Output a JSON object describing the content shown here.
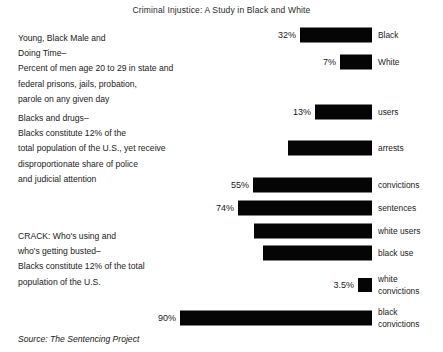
{
  "title": "Criminal Injustice: A Study in Black and White",
  "source": "Source: The Sentencing Project",
  "text_blocks": [
    {
      "lines": [
        "Young, Black Male and",
        "Doing Time–",
        "Percent of men age 20 to 29 in state and",
        "federal prisons, jails, probation,",
        "parole on any given day"
      ]
    },
    {
      "lines": [
        "Blacks and drugs–",
        "Blacks constitute 12% of the",
        "total population of the U.S., yet receive",
        "disproportionate share of police",
        "and judicial attention"
      ]
    },
    {
      "lines": [
        "CRACK: Who's using and",
        "who's getting busted–",
        "Blacks constitute 12% of the total",
        "population of the U.S."
      ]
    }
  ],
  "chart_data": {
    "type": "bar",
    "title": "Criminal Injustice: A Study in Black and White",
    "xlabel": "",
    "ylabel": "",
    "orientation": "horizontal",
    "bars_right_aligned": true,
    "grid": false,
    "legend": "none",
    "xlim": [
      0,
      100
    ],
    "categories": [
      "Black",
      "White",
      "users",
      "arrests",
      "convictions",
      "sentences",
      "white users",
      "black use",
      "white convictions",
      "black convictions"
    ],
    "values": [
      32,
      7,
      13,
      28,
      55,
      74,
      52,
      47,
      3.5,
      90
    ],
    "value_labels": [
      "32%",
      "7%",
      "13%",
      "",
      "55%",
      "74%",
      "",
      "",
      "3.5%",
      "90%"
    ],
    "bars": [
      {
        "label": "Black",
        "label_lines": [
          "Black"
        ],
        "value": 32,
        "value_label": "32%",
        "top": 35,
        "left": 300,
        "width": 72,
        "labeled": true
      },
      {
        "label": "White",
        "label_lines": [
          "White"
        ],
        "value": 7,
        "value_label": "7%",
        "top": 62,
        "left": 340,
        "width": 32,
        "labeled": true
      },
      {
        "label": "users",
        "label_lines": [
          "users"
        ],
        "value": 13,
        "value_label": "13%",
        "top": 112,
        "left": 315,
        "width": 57,
        "labeled": true
      },
      {
        "label": "arrests",
        "label_lines": [
          "arrests"
        ],
        "value": 28,
        "value_label": "",
        "top": 148,
        "left": 288,
        "width": 84,
        "labeled": false
      },
      {
        "label": "convictions",
        "label_lines": [
          "convictions"
        ],
        "value": 55,
        "value_label": "55%",
        "top": 185,
        "left": 253,
        "width": 119,
        "labeled": true
      },
      {
        "label": "sentences",
        "label_lines": [
          "sentences"
        ],
        "value": 74,
        "value_label": "74%",
        "top": 208,
        "left": 238,
        "width": 134,
        "labeled": true
      },
      {
        "label": "white users",
        "label_lines": [
          "white users"
        ],
        "value": 52,
        "value_label": "",
        "top": 231,
        "left": 254,
        "width": 118,
        "labeled": false
      },
      {
        "label": "black use",
        "label_lines": [
          "black use"
        ],
        "value": 47,
        "value_label": "",
        "top": 253,
        "left": 263,
        "width": 109,
        "labeled": false
      },
      {
        "label": "white convictions",
        "label_lines": [
          "white",
          "convictions"
        ],
        "value": 3.5,
        "value_label": "3.5%",
        "top": 285,
        "left": 358,
        "width": 14,
        "labeled": true
      },
      {
        "label": "black convictions",
        "label_lines": [
          "black",
          "convictions"
        ],
        "value": 90,
        "value_label": "90%",
        "top": 318,
        "left": 180,
        "width": 192,
        "labeled": true
      }
    ],
    "colors": {
      "bar": "#050505",
      "text": "#222222",
      "background": "#ffffff"
    }
  }
}
